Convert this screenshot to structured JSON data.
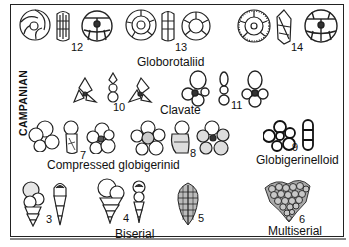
{
  "figure": {
    "stage_label": "CAMPANIAN",
    "groups": [
      {
        "name": "Globorotaliid",
        "specimens": [
          "12",
          "13",
          "14"
        ]
      },
      {
        "name": "Clavate",
        "specimens": [
          "10",
          "11"
        ]
      },
      {
        "name": "Compressed globigerinid",
        "specimens": [
          "7",
          "8"
        ]
      },
      {
        "name": "Globigerinelloid",
        "specimens": [
          "9"
        ]
      },
      {
        "name": "Biserial",
        "specimens": [
          "3",
          "4"
        ]
      },
      {
        "name": "",
        "specimens": [
          "5"
        ]
      },
      {
        "name": "Multiserial",
        "specimens": [
          "6"
        ]
      }
    ]
  },
  "labels": {
    "globorotaliid": "Globorotaliid",
    "clavate": "Clavate",
    "compressed": "Compressed globigerinid",
    "globigerinelloid": "Globigerinelloid",
    "biserial": "Biserial",
    "multiserial": "Multiserial"
  },
  "numbers": {
    "n3": "3",
    "n4": "4",
    "n5": "5",
    "n6": "6",
    "n7": "7",
    "n8": "8",
    "n9": "9",
    "n10": "10",
    "n11": "11",
    "n12": "12",
    "n13": "13",
    "n14": "14"
  }
}
